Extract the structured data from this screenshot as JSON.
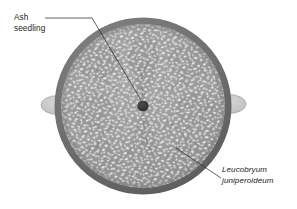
{
  "figure": {
    "type": "cross-section-diagram",
    "background_color": "#ffffff"
  },
  "annotations": [
    {
      "id": "ash-seedling",
      "line1": "Ash",
      "line2": "seedling",
      "style": "regular",
      "points_to": "central-dark-dot"
    },
    {
      "id": "leucobryum",
      "line1": "Leucobryum",
      "line2": "juniperoideum",
      "style": "italic",
      "points_to": "moss-cushion-body"
    }
  ],
  "elements": {
    "outer_ring": {
      "name": "pot-rim",
      "color": "#6f6f6f",
      "center_x": 143,
      "center_y": 106,
      "radius": 85,
      "stroke_width": 7
    },
    "moss_fill": {
      "name": "moss-texture-fill",
      "base_color": "#9a9a9a",
      "speck_color": "#f2f2f2"
    },
    "central_dot": {
      "name": "ash-seedling-stem",
      "color": "#3a3a3a",
      "center_x": 143,
      "center_y": 106,
      "radius": 5.5
    },
    "side_lobes": {
      "name": "lateral-lobes",
      "fill": "#c9c9c9",
      "stroke": "#9f9f9f",
      "left_center_x": 58,
      "right_center_x": 228,
      "center_y": 105,
      "rx": 16,
      "ry": 9
    },
    "leader_lines": {
      "color": "#333333",
      "width": 0.7
    }
  },
  "colors": {
    "ring": "#6f6f6f",
    "moss_base": "#9a9a9a",
    "moss_speck": "#f2f2f2",
    "cushion_outline": "#868686",
    "dot": "#3a3a3a",
    "lobe": "#c9c9c9",
    "text": "#1b1b1b"
  }
}
